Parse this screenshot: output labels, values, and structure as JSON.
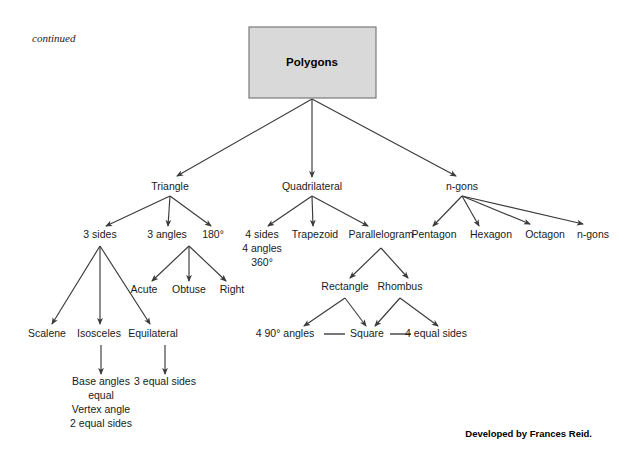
{
  "page": {
    "continued_note": "continued",
    "credit": "Developed by Frances Reid.",
    "background_color": "#ffffff",
    "box_fill_color": "#d9d9d9",
    "box_border_color": "#7a7a7a",
    "arrow_color": "#3b3b3b",
    "text_color": "#1a1a1a"
  },
  "diagram": {
    "type": "tree",
    "root": {
      "label": "Polygons",
      "shape": "rectangle",
      "x": 312,
      "y": 62,
      "box": {
        "x": 249,
        "y": 27,
        "width": 127,
        "height": 71
      }
    },
    "level1": [
      {
        "id": "triangle",
        "label": "Triangle",
        "x": 170,
        "y": 190
      },
      {
        "id": "quadrilateral",
        "label": "Quadrilateral",
        "x": 312,
        "y": 190
      },
      {
        "id": "ngons",
        "label": "n-gons",
        "x": 462,
        "y": 190
      }
    ],
    "level2": [
      {
        "id": "three-sides",
        "parent": "triangle",
        "label": "3 sides",
        "x": 100,
        "y": 238
      },
      {
        "id": "three-angles",
        "parent": "triangle",
        "label": "3 angles",
        "x": 167,
        "y": 238
      },
      {
        "id": "one-eighty",
        "parent": "triangle",
        "label": "180°",
        "x": 213,
        "y": 238
      },
      {
        "id": "four-sides",
        "parent": "quadrilateral",
        "label": "4 sides",
        "x": 262,
        "y": 238
      },
      {
        "id": "trapezoid",
        "parent": "quadrilateral",
        "label": "Trapezoid",
        "x": 315,
        "y": 238
      },
      {
        "id": "parallelogram",
        "parent": "quadrilateral",
        "label": "Parallelogram",
        "x": 381,
        "y": 238
      },
      {
        "id": "pentagon",
        "parent": "ngons",
        "label": "Pentagon",
        "x": 434,
        "y": 238
      },
      {
        "id": "hexagon",
        "parent": "ngons",
        "label": "Hexagon",
        "x": 491,
        "y": 238
      },
      {
        "id": "octagon",
        "parent": "ngons",
        "label": "Octagon",
        "x": 545,
        "y": 238
      },
      {
        "id": "ngons-leaf",
        "parent": "ngons",
        "label": "n-gons",
        "x": 593,
        "y": 238
      }
    ],
    "quad_detail": [
      {
        "id": "four-angles",
        "label": "4 angles",
        "x": 262,
        "y": 252
      },
      {
        "id": "three-sixty",
        "label": "360°",
        "x": 262,
        "y": 266
      }
    ],
    "level3": [
      {
        "id": "acute",
        "parent": "three-angles",
        "label": "Acute",
        "x": 144,
        "y": 293
      },
      {
        "id": "obtuse",
        "parent": "three-angles",
        "label": "Obtuse",
        "x": 189,
        "y": 293
      },
      {
        "id": "right",
        "parent": "three-angles",
        "label": "Right",
        "x": 232,
        "y": 293
      },
      {
        "id": "rectangle",
        "parent": "parallelogram",
        "label": "Rectangle",
        "x": 345,
        "y": 290
      },
      {
        "id": "rhombus",
        "parent": "parallelogram",
        "label": "Rhombus",
        "x": 400,
        "y": 290
      }
    ],
    "level4": [
      {
        "id": "scalene",
        "parent": "three-sides",
        "label": "Scalene",
        "x": 47,
        "y": 337
      },
      {
        "id": "isosceles",
        "parent": "three-sides",
        "label": "Isosceles",
        "x": 99,
        "y": 337
      },
      {
        "id": "equilateral",
        "parent": "three-sides",
        "label": "Equilateral",
        "x": 153,
        "y": 337
      },
      {
        "id": "ninety-angles",
        "label": "4 90° angles",
        "x": 285,
        "y": 337
      },
      {
        "id": "square",
        "label": "Square",
        "x": 367,
        "y": 337
      },
      {
        "id": "four-equal-sides",
        "label": "4 equal sides",
        "x": 436,
        "y": 337
      }
    ],
    "level5": [
      {
        "id": "base-angles",
        "parent": "isosceles",
        "label": "Base angles",
        "x": 101,
        "y": 385
      },
      {
        "id": "base-equal",
        "label": "equal",
        "x": 101,
        "y": 399
      },
      {
        "id": "vertex-angle",
        "label": "Vertex angle",
        "x": 101,
        "y": 413
      },
      {
        "id": "two-equal-sides",
        "label": "2 equal sides",
        "x": 101,
        "y": 427
      },
      {
        "id": "three-equal-sides",
        "parent": "equilateral",
        "label": "3 equal sides",
        "x": 165,
        "y": 385
      }
    ],
    "plain_links": [
      {
        "from": "ninety-angles",
        "to": "square"
      },
      {
        "from": "square",
        "to": "four-equal-sides"
      }
    ]
  }
}
